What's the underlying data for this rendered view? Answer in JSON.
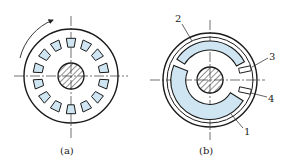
{
  "figure": {
    "panels": [
      {
        "id": "a",
        "caption": "(a)",
        "description": "Incremental encoder disk with 14 evenly spaced slots and rotation arrow"
      },
      {
        "id": "b",
        "caption": "(b)",
        "description": "Absolute/quadrature encoder disk with two tracks and two sensor windows"
      }
    ],
    "callouts": [
      {
        "number": "1",
        "target": "inner arc track"
      },
      {
        "number": "2",
        "target": "outer arc track"
      },
      {
        "number": "3",
        "target": "upper sensor window"
      },
      {
        "number": "4",
        "target": "lower sensor window"
      }
    ],
    "colors": {
      "slot_fill": "#cfe6f2",
      "stroke": "#1a1a1a",
      "background": "#ffffff"
    },
    "slot_count_a": 14
  }
}
